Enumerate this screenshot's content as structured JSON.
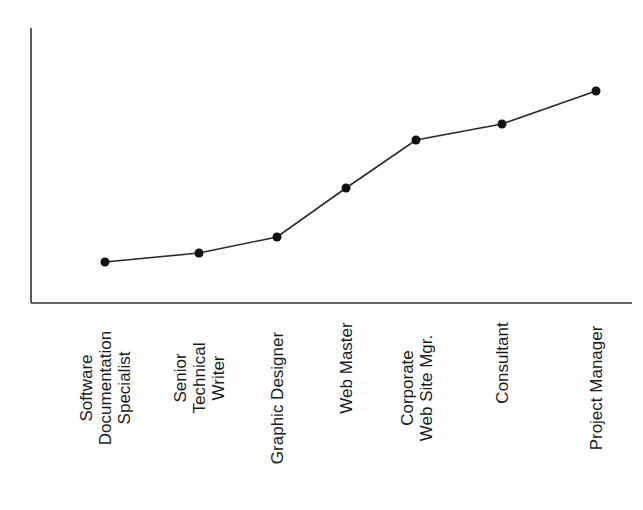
{
  "chart_data": {
    "type": "line",
    "title": "",
    "xlabel": "",
    "ylabel": "",
    "grid": false,
    "legend": null,
    "categories": [
      "Software Documentation Specialist",
      "Senior Technical Writer",
      "Graphic Designer",
      "Web Master",
      "Corporate Web Site Mgr.",
      "Consultant",
      "Project Manager"
    ],
    "category_label_lines": [
      [
        "Software",
        "Documentation",
        "Specialist"
      ],
      [
        "Senior",
        "Technical",
        "Writer"
      ],
      [
        "Graphic Designer"
      ],
      [
        "Web Master"
      ],
      [
        "Corporate",
        "Web Site Mgr."
      ],
      [
        "Consultant"
      ],
      [
        "Project Manager"
      ]
    ],
    "values": [
      15,
      18,
      24,
      42,
      60,
      66,
      78
    ],
    "ylim": [
      0,
      100
    ],
    "y_ticks": [],
    "marker": "filled-circle",
    "line_color": "#2a2a2a",
    "marker_color": "#111111",
    "axis_color": "#333333"
  }
}
